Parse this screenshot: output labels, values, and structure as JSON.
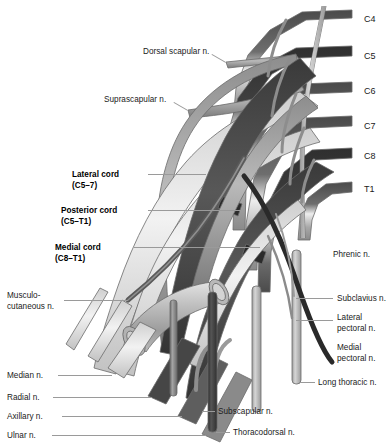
{
  "figure": {
    "background_color": "#ffffff",
    "text_color": "#1a1a1a",
    "leader_color": "#9a9a9a",
    "width": 390,
    "height": 444
  },
  "palette": {
    "nerve_darkest": "#3d3d3d",
    "nerve_dark": "#5a5a5a",
    "nerve_mid": "#7f7f7f",
    "nerve_light": "#b5b5b5",
    "nerve_lightest": "#dcdcdc",
    "nerve_pale": "#ececec",
    "outline": "#6b6b6b",
    "artery": "#c9c9c9"
  },
  "roots": [
    {
      "label": "C4",
      "x": 364,
      "y": 14
    },
    {
      "label": "C5",
      "x": 364,
      "y": 51
    },
    {
      "label": "C6",
      "x": 364,
      "y": 86
    },
    {
      "label": "C7",
      "x": 364,
      "y": 121
    },
    {
      "label": "C8",
      "x": 364,
      "y": 151
    },
    {
      "label": "T1",
      "x": 364,
      "y": 184
    }
  ],
  "labels_left": [
    {
      "key": "dorsal_scapular",
      "lines": [
        "Dorsal scapular n."
      ],
      "x": 143,
      "y": 47,
      "bold": false
    },
    {
      "key": "suprascapular",
      "lines": [
        "Suprascapular n."
      ],
      "x": 104,
      "y": 95,
      "bold": false
    },
    {
      "key": "lateral_cord",
      "lines": [
        "Lateral cord",
        "(C5–7)"
      ],
      "x": 72,
      "y": 170,
      "bold": true
    },
    {
      "key": "posterior_cord",
      "lines": [
        "Posterior cord",
        "(C5–T1)"
      ],
      "x": 61,
      "y": 206,
      "bold": true
    },
    {
      "key": "medial_cord",
      "lines": [
        "Medial cord",
        "(C8–T1)"
      ],
      "x": 55,
      "y": 243,
      "bold": true
    },
    {
      "key": "musculocutaneous",
      "lines": [
        "Musculo-",
        "cutaneous n."
      ],
      "x": 7,
      "y": 291,
      "bold": false
    },
    {
      "key": "median",
      "lines": [
        "Median n."
      ],
      "x": 7,
      "y": 371,
      "bold": false
    },
    {
      "key": "radial",
      "lines": [
        "Radial n."
      ],
      "x": 7,
      "y": 393,
      "bold": false
    },
    {
      "key": "axillary",
      "lines": [
        "Axillary n."
      ],
      "x": 7,
      "y": 412,
      "bold": false
    },
    {
      "key": "ulnar",
      "lines": [
        "Ulnar n."
      ],
      "x": 7,
      "y": 431,
      "bold": false
    }
  ],
  "labels_right": [
    {
      "key": "phrenic",
      "lines": [
        "Phrenic n."
      ],
      "x": 333,
      "y": 250,
      "bold": false
    },
    {
      "key": "subclavius",
      "lines": [
        "Subclavius n."
      ],
      "x": 337,
      "y": 294,
      "bold": false
    },
    {
      "key": "lateral_pectoral",
      "lines": [
        "Lateral",
        "pectoral n."
      ],
      "x": 337,
      "y": 313,
      "bold": false
    },
    {
      "key": "medial_pectoral",
      "lines": [
        "Medial",
        "pectoral n."
      ],
      "x": 337,
      "y": 343,
      "bold": false
    },
    {
      "key": "long_thoracic",
      "lines": [
        "Long thoracic n."
      ],
      "x": 318,
      "y": 378,
      "bold": false
    },
    {
      "key": "subscapular",
      "lines": [
        "Subscapular n."
      ],
      "x": 218,
      "y": 407,
      "bold": false
    },
    {
      "key": "thoracodorsal",
      "lines": [
        "Thoracodorsal n."
      ],
      "x": 233,
      "y": 428,
      "bold": false
    }
  ],
  "leaders": [
    {
      "key": "leader-dorsal-scapular",
      "x1": 212,
      "y1": 54,
      "x2": 226,
      "y2": 62
    },
    {
      "key": "leader-suprascapular",
      "x1": 174,
      "y1": 102,
      "x2": 188,
      "y2": 110
    },
    {
      "key": "leader-lateral-cord",
      "x1": 148,
      "y1": 174,
      "x2": 206,
      "y2": 174
    },
    {
      "key": "leader-posterior-cord",
      "x1": 148,
      "y1": 210,
      "x2": 242,
      "y2": 210
    },
    {
      "key": "leader-medial-cord",
      "x1": 134,
      "y1": 247,
      "x2": 260,
      "y2": 247
    },
    {
      "key": "leader-musculocutaneous",
      "x1": 64,
      "y1": 300,
      "x2": 128,
      "y2": 300
    },
    {
      "key": "leader-median",
      "x1": 58,
      "y1": 375,
      "x2": 112,
      "y2": 375
    },
    {
      "key": "leader-radial",
      "x1": 53,
      "y1": 397,
      "x2": 152,
      "y2": 397
    },
    {
      "key": "leader-axillary",
      "x1": 62,
      "y1": 416,
      "x2": 182,
      "y2": 416
    },
    {
      "key": "leader-ulnar",
      "x1": 52,
      "y1": 435,
      "x2": 206,
      "y2": 435
    },
    {
      "key": "leader-subclavius",
      "x1": 296,
      "y1": 298,
      "x2": 333,
      "y2": 298
    },
    {
      "key": "leader-lateral-pectoral",
      "x1": 296,
      "y1": 320,
      "x2": 333,
      "y2": 320
    },
    {
      "key": "leader-long-thoracic",
      "x1": 300,
      "y1": 382,
      "x2": 315,
      "y2": 382
    },
    {
      "key": "leader-subscapular",
      "x1": 202,
      "y1": 411,
      "x2": 215,
      "y2": 411
    },
    {
      "key": "leader-thoracodorsal",
      "x1": 216,
      "y1": 432,
      "x2": 230,
      "y2": 432
    }
  ],
  "structures": [
    {
      "key": "root-c4",
      "name": "C4 spinal nerve root"
    },
    {
      "key": "root-c5",
      "name": "C5 spinal nerve root"
    },
    {
      "key": "root-c6",
      "name": "C6 spinal nerve root"
    },
    {
      "key": "root-c7",
      "name": "C7 spinal nerve root"
    },
    {
      "key": "root-c8",
      "name": "C8 spinal nerve root"
    },
    {
      "key": "root-t1",
      "name": "T1 spinal nerve root"
    },
    {
      "key": "lateral-cord",
      "name": "Lateral cord"
    },
    {
      "key": "posterior-cord",
      "name": "Posterior cord"
    },
    {
      "key": "medial-cord",
      "name": "Medial cord"
    },
    {
      "key": "axillary-artery",
      "name": "Axillary artery"
    },
    {
      "key": "median-nerve",
      "name": "Median nerve"
    },
    {
      "key": "radial-nerve",
      "name": "Radial nerve"
    },
    {
      "key": "axillary-nerve",
      "name": "Axillary nerve"
    },
    {
      "key": "ulnar-nerve",
      "name": "Ulnar nerve"
    },
    {
      "key": "musculocutaneous-nerve",
      "name": "Musculocutaneous nerve"
    },
    {
      "key": "phrenic-nerve",
      "name": "Phrenic nerve"
    },
    {
      "key": "long-thoracic-nerve",
      "name": "Long thoracic nerve"
    },
    {
      "key": "subscapular-nerve",
      "name": "Subscapular nerve"
    },
    {
      "key": "thoracodorsal-nerve",
      "name": "Thoracodorsal nerve"
    },
    {
      "key": "dorsal-scapular-nerve",
      "name": "Dorsal scapular nerve"
    },
    {
      "key": "suprascapular-nerve",
      "name": "Suprascapular nerve"
    },
    {
      "key": "medial-pectoral-nerve",
      "name": "Medial pectoral nerve"
    },
    {
      "key": "lateral-pectoral-nerve",
      "name": "Lateral pectoral nerve"
    },
    {
      "key": "subclavius-nerve",
      "name": "Subclavius nerve"
    }
  ]
}
